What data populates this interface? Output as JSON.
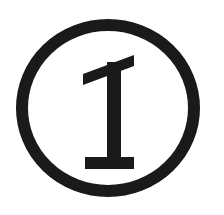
{
  "image": {
    "kind": "symbol-mark",
    "description": "Circled capital letter I",
    "character": "I",
    "enclosure": "circle",
    "background_color": "#ffffff",
    "ink_color": "#1a1a1a",
    "canvas": {
      "width": 224,
      "height": 215
    }
  },
  "circle": {
    "label": "enclosing-circle",
    "center_x": 108,
    "center_y": 108,
    "radius_x": 92,
    "radius_y": 89,
    "stroke_width": 12,
    "stroke_color": "#1a1a1a",
    "fill": "none"
  },
  "letter": {
    "label": "letter-i",
    "glyph": "I",
    "style": "serif-slab",
    "color": "#1a1a1a",
    "stem": {
      "x_left": 107,
      "x_right": 121,
      "y_top": 62,
      "y_bottom": 158
    },
    "top_serif": {
      "x_left": 83,
      "x_right": 134,
      "y_left": 74,
      "y_right": 55,
      "thickness": 11,
      "slanted": "true"
    },
    "bottom_serif": {
      "x_left": 85,
      "x_right": 134,
      "y_top": 157,
      "y_bottom": 169,
      "thickness": 12,
      "slanted": "false"
    }
  },
  "accessibility": {
    "alt_text": "Circled capital letter I",
    "caption": "I"
  }
}
